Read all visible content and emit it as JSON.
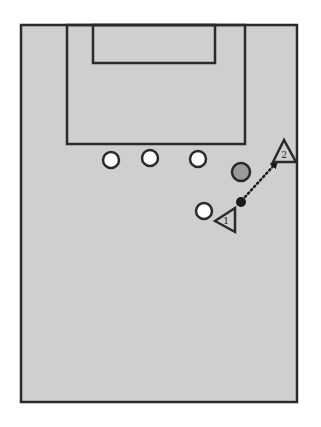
{
  "diagram": {
    "title": "",
    "type": "soccer-drill",
    "colors": {
      "background": "#ffffff",
      "field": "#cfcfcf",
      "lines": "#2a2a2a",
      "defender_fill": "#ffffff",
      "neutral_fill": "#9a9a9a",
      "ball_fill": "#1a1a1a"
    },
    "field": {
      "x": 21,
      "y": 25,
      "width": 276,
      "height": 377
    },
    "penalty_box": {
      "x": 67,
      "y": 25,
      "width": 178,
      "height": 119
    },
    "goal_box": {
      "x": 93,
      "y": 25,
      "width": 122,
      "height": 38
    },
    "defenders": [
      {
        "id": "defender-1",
        "cx": 111,
        "cy": 160,
        "r": 8
      },
      {
        "id": "defender-2",
        "cx": 150,
        "cy": 158,
        "r": 8
      },
      {
        "id": "defender-3",
        "cx": 198,
        "cy": 159,
        "r": 8
      },
      {
        "id": "defender-4",
        "cx": 204,
        "cy": 211,
        "r": 8
      }
    ],
    "neutral_player": {
      "cx": 241,
      "cy": 172,
      "r": 9
    },
    "ball": {
      "cx": 241,
      "cy": 202,
      "r": 5
    },
    "attackers": [
      {
        "id": "attacker-1",
        "label": "1",
        "points": "215,221 235,208 235,232",
        "label_x": 226,
        "label_y": 224
      },
      {
        "id": "attacker-2",
        "label": "2",
        "points": "284,140 273,162 296,162",
        "label_x": 284,
        "label_y": 158
      }
    ],
    "pass": {
      "x1": 245,
      "y1": 197,
      "x2": 276,
      "y2": 163,
      "style": "dotted-arrow"
    }
  }
}
